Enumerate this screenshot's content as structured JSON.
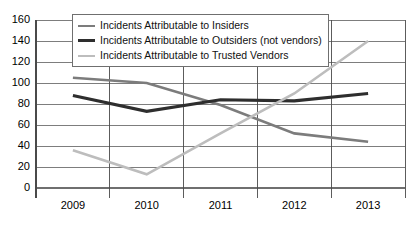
{
  "chart_data": {
    "type": "line",
    "title": "",
    "xlabel": "",
    "ylabel": "",
    "categories": [
      "2009",
      "2010",
      "2011",
      "2012",
      "2013"
    ],
    "ylim": [
      0,
      160
    ],
    "yticks": [
      0,
      20,
      40,
      60,
      80,
      100,
      120,
      140,
      160
    ],
    "grid": true,
    "legend_position": "top-left-inside",
    "series": [
      {
        "name": "Incidents Attributable to Insiders",
        "color": "#7c7c7c",
        "values": [
          105,
          100,
          79,
          52,
          44
        ]
      },
      {
        "name": "Incidents Attributable to Outsiders (not vendors)",
        "color": "#2e2e2e",
        "values": [
          88,
          73,
          84,
          83,
          90
        ]
      },
      {
        "name": "Incidents Attributable to Trusted Vendors",
        "color": "#bdbdbd",
        "values": [
          36,
          13,
          52,
          90,
          140
        ]
      }
    ]
  },
  "axis": {
    "y_labels": [
      "160",
      "140",
      "120",
      "100",
      "80",
      "60",
      "40",
      "20",
      "0"
    ],
    "x_labels": [
      "2009",
      "2010",
      "2011",
      "2012",
      "2013"
    ]
  },
  "legend": {
    "items": [
      {
        "label": "Incidents Attributable to Insiders",
        "color": "#7c7c7c",
        "width": "2.5px"
      },
      {
        "label": "Incidents Attributable to Outsiders (not vendors)",
        "color": "#2e2e2e",
        "width": "3px"
      },
      {
        "label": "Incidents Attributable to Trusted Vendors",
        "color": "#bdbdbd",
        "width": "2.5px"
      }
    ]
  },
  "colors": {
    "grid": "#6f6f6f",
    "axis": "#4a4a4a",
    "background": "#ffffff"
  }
}
